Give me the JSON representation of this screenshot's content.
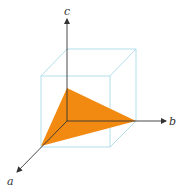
{
  "diagram": {
    "axes": [
      {
        "name": "a",
        "label": "a"
      },
      {
        "name": "b",
        "label": "b"
      },
      {
        "name": "c",
        "label": "c"
      }
    ],
    "plane_color": "#f28a12",
    "cube_color": "#9fd6e6",
    "axis_color": "#333333"
  }
}
